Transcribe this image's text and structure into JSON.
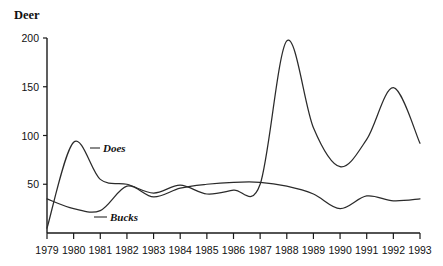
{
  "chart_data": {
    "type": "line",
    "title": "Deer",
    "xlabel": "",
    "ylabel": "Deer",
    "xlim": [
      1979,
      1993
    ],
    "ylim": [
      0,
      200
    ],
    "grid": false,
    "legend_position": "inline-annotations",
    "ytick_labels": [
      "200",
      "150",
      "100",
      "50"
    ],
    "ytick_values": [
      200,
      150,
      100,
      50
    ],
    "xtick_labels": [
      "1979",
      "1980",
      "1981",
      "1982",
      "1983",
      "1984",
      "1985",
      "1986",
      "1987",
      "1988",
      "1989",
      "1990",
      "1991",
      "1992",
      "1993"
    ],
    "x": [
      1979,
      1980,
      1981,
      1982,
      1983,
      1984,
      1985,
      1986,
      1987,
      1988,
      1989,
      1990,
      1991,
      1992,
      1993
    ],
    "series": [
      {
        "name": "Does",
        "label": "Does",
        "values": [
          5,
          93,
          55,
          50,
          41,
          49,
          40,
          44,
          50,
          197,
          108,
          68,
          96,
          149,
          92
        ]
      },
      {
        "name": "Bucks",
        "label": "Bucks",
        "values": [
          35,
          25,
          23,
          48,
          37,
          46,
          50,
          52,
          52,
          48,
          40,
          25,
          38,
          33,
          35
        ]
      }
    ],
    "annotations": [
      {
        "text": "Does",
        "near_year": 1980,
        "near_value": 88
      },
      {
        "text": "Bucks",
        "near_year": 1981,
        "near_value": 24
      }
    ]
  }
}
